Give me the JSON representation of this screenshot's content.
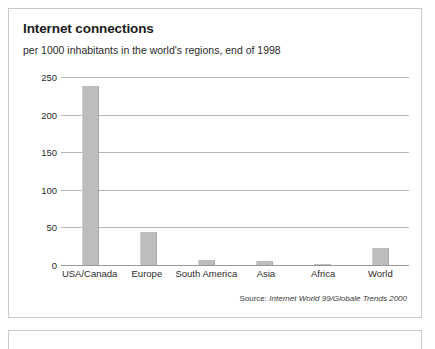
{
  "card": {
    "title": "Internet connections",
    "subtitle": "per 1000 inhabitants in the world's regions, end of 1998",
    "source_label": "Source:",
    "source_text": "Internet World 99/Globale Trends 2000"
  },
  "colors": {
    "bar": "#bdbdbd",
    "gridline": "#b5b5b5",
    "border": "#c9c9c9",
    "text": "#2b2b2b"
  },
  "chart_data": {
    "type": "bar",
    "title": "Internet connections",
    "subtitle": "per 1000 inhabitants in the world's regions, end of 1998",
    "xlabel": "",
    "ylabel": "",
    "categories": [
      "USA/Canada",
      "Europe",
      "South America",
      "Asia",
      "Africa",
      "World"
    ],
    "values": [
      238,
      44,
      7,
      6,
      2,
      23
    ],
    "series": [
      {
        "name": "Internet connections per 1000 inhabitants",
        "values": [
          238,
          44,
          7,
          6,
          2,
          23
        ]
      }
    ],
    "ylim": [
      0,
      250
    ],
    "yticks": [
      0,
      50,
      100,
      150,
      200,
      250
    ],
    "ytick_labels": [
      "0",
      "50",
      "100",
      "150",
      "200",
      "250"
    ],
    "grid": true,
    "legend": false,
    "legend_position": "none",
    "annotations": [
      "Source: Internet World 99/Globale Trends 2000"
    ]
  }
}
